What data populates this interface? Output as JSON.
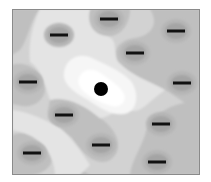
{
  "diagram": {
    "title": "",
    "frame": {
      "x": 12,
      "y": 9,
      "width": 188,
      "height": 166,
      "border_color": "#8a8a8a"
    },
    "colors": {
      "background_level": "#c4c4c4",
      "mid_level": "#d6d6d6",
      "light_level": "#e6e6e6",
      "near_center_level": "#f4f4f4",
      "center_level": "#ffffff",
      "charge_halo_outer": "#b6b6b6",
      "charge_halo_inner": "#a4a4a4",
      "negative_charge": "#111111",
      "positive_charge": "#000000"
    },
    "positive_charge": {
      "label": "positive ion",
      "x": 101,
      "y": 89,
      "r": 7
    },
    "negative_charges": [
      {
        "x": 109,
        "y": 19
      },
      {
        "x": 59,
        "y": 35
      },
      {
        "x": 176,
        "y": 31
      },
      {
        "x": 135,
        "y": 53
      },
      {
        "x": 28,
        "y": 82
      },
      {
        "x": 182,
        "y": 83
      },
      {
        "x": 64,
        "y": 115
      },
      {
        "x": 161,
        "y": 124
      },
      {
        "x": 101,
        "y": 145
      },
      {
        "x": 32,
        "y": 153
      },
      {
        "x": 157,
        "y": 162
      }
    ]
  }
}
